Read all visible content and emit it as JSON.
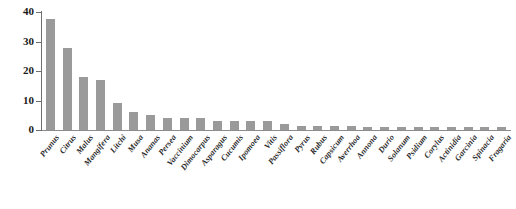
{
  "chart_data": {
    "type": "bar",
    "title": "",
    "xlabel": "",
    "ylabel": "",
    "ylim": [
      0,
      40
    ],
    "yticks": [
      0,
      10,
      20,
      30,
      40
    ],
    "grid": false,
    "legend": "none",
    "bar_color": "#9a9a9a",
    "axis_color": "#6f6f6f",
    "categories": [
      "Prunus",
      "Citrus",
      "Malus",
      "Mangifera",
      "Litchi",
      "Musa",
      "Ananas",
      "Persea",
      "Vaccinium",
      "Dimocarpus",
      "Asparagus",
      "Cucumis",
      "Ipomoea",
      "Vitis",
      "Passiflora",
      "Pyrus",
      "Rubus",
      "Capsicum",
      "Averrhoa",
      "Annona",
      "Durio",
      "Solanum",
      "Psidium",
      "Corylus",
      "Actinidia",
      "Garcinia",
      "Spinacia",
      "Fragaria"
    ],
    "values": [
      37.5,
      27.8,
      18,
      17,
      9,
      6,
      5,
      4,
      4,
      4,
      3,
      3,
      3,
      3,
      2,
      1.5,
      1.5,
      1.5,
      1.5,
      1,
      1,
      1,
      1,
      1,
      1,
      1,
      1,
      1
    ]
  }
}
